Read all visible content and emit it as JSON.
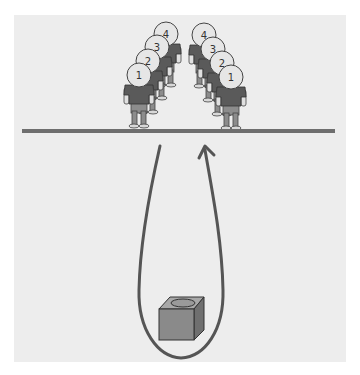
{
  "diagram": {
    "colors": {
      "background": "#ffffff",
      "panel": "#ededed",
      "line": "#6e6e6e",
      "shirt": "#5a5a5a",
      "pants": "#8c8c8c",
      "head": "#e6e6e6",
      "box_front": "#8a8a8a",
      "box_top": "#a8a8a8",
      "box_side": "#6f6f6f",
      "arrow": "#555555"
    },
    "left_line": {
      "labels": [
        "1",
        "2",
        "3",
        "4"
      ]
    },
    "right_line": {
      "labels": [
        "1",
        "2",
        "3",
        "4"
      ]
    },
    "box": {
      "label": "box-with-hole"
    },
    "path": {
      "label": "loop-arrow"
    }
  }
}
